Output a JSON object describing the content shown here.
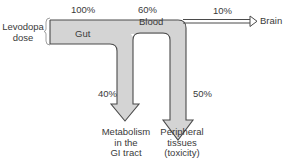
{
  "diagram": {
    "source_label": [
      "Levodopa",
      "dose"
    ],
    "compartments": {
      "gut": "Gut",
      "blood": "Blood"
    },
    "percentages": {
      "dose": "100%",
      "blood": "60%",
      "brain": "10%",
      "gi_metabolism": "40%",
      "peripheral": "50%"
    },
    "destinations": {
      "brain": "Brain",
      "metabolism": [
        "Metabolism",
        "in the",
        "GI tract"
      ],
      "peripheral": [
        "Peripheral",
        "tissues",
        "(toxicity)"
      ]
    },
    "colors": {
      "band_fill": "#d4d4d4",
      "outline": "#4a4a4a",
      "text": "#3a3a3a"
    }
  }
}
